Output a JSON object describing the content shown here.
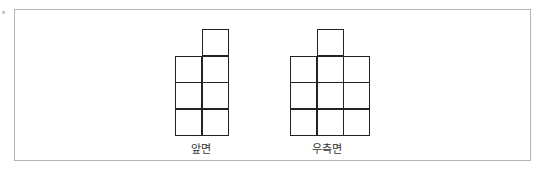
{
  "diagram": {
    "views": [
      {
        "label": "앞면",
        "grid_origin": [
          175,
          29
        ],
        "cell_size": 26.5,
        "columns": 2,
        "rows": 4,
        "filled_cells": [
          [
            1,
            0
          ],
          [
            0,
            1
          ],
          [
            1,
            1
          ],
          [
            0,
            2
          ],
          [
            1,
            2
          ],
          [
            0,
            3
          ],
          [
            1,
            3
          ]
        ]
      },
      {
        "label": "우측면",
        "grid_origin": [
          290,
          29
        ],
        "cell_size": 26.5,
        "columns": 3,
        "rows": 4,
        "filled_cells": [
          [
            1,
            0
          ],
          [
            0,
            1
          ],
          [
            1,
            1
          ],
          [
            2,
            1
          ],
          [
            0,
            2
          ],
          [
            1,
            2
          ],
          [
            2,
            2
          ],
          [
            0,
            3
          ],
          [
            1,
            3
          ],
          [
            2,
            3
          ]
        ]
      }
    ]
  }
}
